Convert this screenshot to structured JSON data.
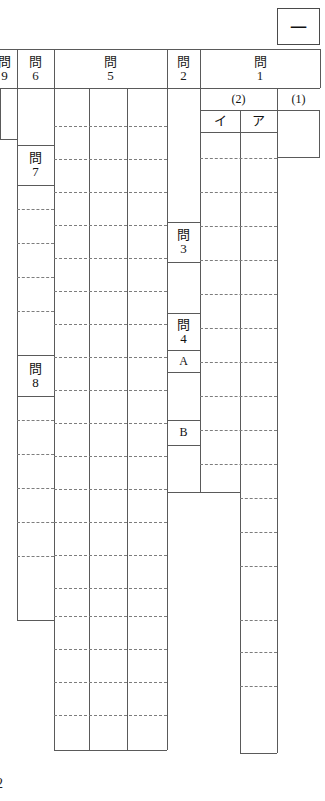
{
  "document": {
    "kind": "answer-sheet",
    "language": "ja",
    "orientation": "vertical-right-to-left"
  },
  "mark_box": {
    "label": "一"
  },
  "section_headers": {
    "q9": {
      "kanji": "問",
      "number": "9"
    },
    "q6": {
      "kanji": "問",
      "number": "6"
    },
    "q5": {
      "kanji": "問",
      "number": "5"
    },
    "q2": {
      "kanji": "問",
      "number": "2"
    },
    "q1": {
      "kanji": "問",
      "number": "1"
    }
  },
  "subheaders": {
    "part2": "(2)",
    "part1": "(1)",
    "kana_i": "イ",
    "kana_a": "ア"
  },
  "row_labels": {
    "q7": {
      "kanji": "問",
      "number": "7"
    },
    "q8": {
      "kanji": "問",
      "number": "8"
    },
    "q3": {
      "kanji": "問",
      "number": "3"
    },
    "q4": {
      "kanji": "問",
      "number": "4"
    },
    "a": "A",
    "b": "B"
  },
  "footer": {
    "clipped_number": "2"
  },
  "answers": {
    "q1_part1": "",
    "q1_kana_i": "",
    "q1_kana_a": "",
    "q2": "",
    "q3": "",
    "q4_a": "",
    "q4_b": "",
    "q5_col1": "",
    "q5_col2": "",
    "q5_col3": "",
    "q6": "",
    "q7": "",
    "q8": "",
    "q9": ""
  }
}
